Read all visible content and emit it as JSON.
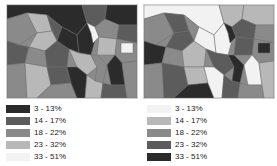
{
  "maps": [
    {
      "id": "left",
      "legend": [
        {
          "label": "3 - 13%",
          "color": "#2b2b2b"
        },
        {
          "label": "14 - 17%",
          "color": "#5c5c5c"
        },
        {
          "label": "18 - 22%",
          "color": "#8a8a8a"
        },
        {
          "label": "23 - 32%",
          "color": "#b8b8b8"
        },
        {
          "label": "33 - 51%",
          "color": "#f2f2f2"
        }
      ]
    },
    {
      "id": "right",
      "legend": [
        {
          "label": "3 - 13%",
          "color": "#f2f2f2"
        },
        {
          "label": "14 - 17%",
          "color": "#b8b8b8"
        },
        {
          "label": "18 - 22%",
          "color": "#8a8a8a"
        },
        {
          "label": "23 - 32%",
          "color": "#5c5c5c"
        },
        {
          "label": "33 - 51%",
          "color": "#2b2b2b"
        }
      ]
    }
  ]
}
